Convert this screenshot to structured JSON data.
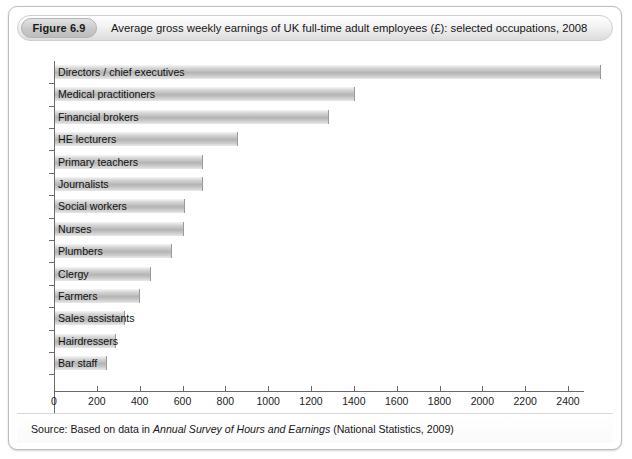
{
  "figure": {
    "badge": "Figure 6.9",
    "title": "Average gross weekly earnings of UK full-time adult employees (£): selected occupations, 2008",
    "source_prefix": "Source: Based on data in ",
    "source_italic": "Annual Survey of Hours and Earnings",
    "source_suffix": " (National Statistics, 2009)"
  },
  "chart_data": {
    "type": "bar",
    "orientation": "horizontal",
    "title": "Average gross weekly earnings of UK full-time adult employees (£): selected occupations, 2008",
    "xlabel": "",
    "ylabel": "",
    "xlim": [
      0,
      2600
    ],
    "grid": false,
    "legend": "none",
    "xticks": [
      0,
      200,
      400,
      600,
      800,
      1000,
      1200,
      1400,
      1600,
      1800,
      2000,
      2200,
      2400
    ],
    "xtick_labels": [
      "0",
      "200",
      "400",
      "600",
      "800",
      "1000",
      "1200",
      "1400",
      "1600",
      "1800",
      "2000",
      "2200",
      "2400"
    ],
    "categories": [
      "Directors / chief executives",
      "Medical practitioners",
      "Financial brokers",
      "HE lecturers",
      "Primary teachers",
      "Journalists",
      "Social workers",
      "Nurses",
      "Plumbers",
      "Clergy",
      "Farmers",
      "Sales assistants",
      "Hairdressers",
      "Bar staff"
    ],
    "values": [
      2550,
      1400,
      1280,
      855,
      690,
      690,
      605,
      600,
      545,
      450,
      395,
      325,
      285,
      245
    ],
    "bar_color": "#c0c0c0"
  }
}
